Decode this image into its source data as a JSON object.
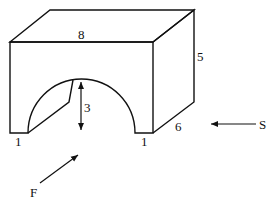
{
  "diagram": {
    "title": "",
    "object": "block-with-half-cylinder-arch-cutout",
    "dimensions": {
      "width_label": "8",
      "height_label": "5",
      "depth_label": "6",
      "arch_radius_label": "3",
      "left_foot_label": "1",
      "right_foot_label": "1"
    },
    "views": {
      "front_label": "F",
      "side_label": "S"
    },
    "colors": {
      "stroke": "#111111",
      "background": "#ffffff"
    }
  }
}
